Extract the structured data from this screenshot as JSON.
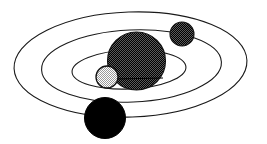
{
  "figure": {
    "width": 267,
    "height": 144,
    "background_color": "#ffffff",
    "stroke_color": "#1a1a1a",
    "stroke_width": 1.1
  },
  "orbits": [
    {
      "id": "orbit-outer",
      "label": "outer orbit",
      "cx": 130.5,
      "cy": 64.5,
      "rx": 116.5,
      "ry": 52.5,
      "rotation": -2.0
    },
    {
      "id": "orbit-middle",
      "label": "middle orbit",
      "cx": 131.5,
      "cy": 66.0,
      "rx": 90.0,
      "ry": 36.0,
      "rotation": -2.5
    },
    {
      "id": "orbit-inner",
      "label": "inner orbit",
      "cx": 129.0,
      "cy": 69.5,
      "rx": 57.0,
      "ry": 19.5,
      "rotation": -2.5
    }
  ],
  "bodies": [
    {
      "id": "body-primary",
      "label": "large dark sphere",
      "cx": 136.5,
      "cy": 61.0,
      "r": 29.0,
      "fill_style": "dark-dither",
      "fill_color": "#2b2b2b",
      "outline_color": "#111111"
    },
    {
      "id": "body-upper-right",
      "label": "small dark sphere upper right",
      "cx": 182.0,
      "cy": 34.0,
      "r": 12.0,
      "fill_style": "dark-dither",
      "fill_color": "#2b2b2b",
      "outline_color": "#111111"
    },
    {
      "id": "body-light",
      "label": "small light stippled sphere",
      "cx": 107.0,
      "cy": 77.0,
      "r": 11.0,
      "fill_style": "light-dither",
      "fill_color": "#d9d9d9",
      "outline_color": "#111111"
    },
    {
      "id": "body-lower",
      "label": "solid black sphere lower",
      "cx": 105.0,
      "cy": 118.0,
      "r": 20.5,
      "fill_style": "solid",
      "fill_color": "#000000",
      "outline_color": "#000000"
    }
  ],
  "marks": [
    {
      "id": "equator-tick",
      "label": "horizontal tick across primary sphere",
      "x1": 116.0,
      "y1": 79.0,
      "x2": 163.0,
      "y2": 78.0,
      "color": "#000000"
    }
  ]
}
